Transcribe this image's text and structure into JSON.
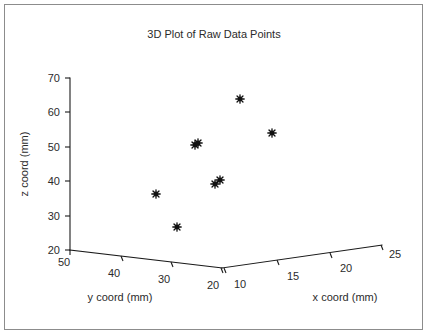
{
  "figure": {
    "border_color": "#8c8c8c",
    "background": "#ffffff",
    "ink_color": "#1a1a1a"
  },
  "chart_data": {
    "type": "scatter",
    "projection": "3d",
    "title": "3D Plot of Raw Data Points",
    "xlabel": "x coord (mm)",
    "ylabel": "y coord (mm)",
    "zlabel": "z coord (mm)",
    "xlim": [
      10,
      25
    ],
    "ylim": [
      20,
      50
    ],
    "zlim": [
      20,
      70
    ],
    "xticks": [
      10,
      15,
      20,
      25
    ],
    "yticks": [
      50,
      40,
      30,
      20
    ],
    "zticks": [
      20,
      30,
      40,
      50,
      60,
      70
    ],
    "xtick_labels": [
      "10",
      "15",
      "20",
      "25"
    ],
    "ytick_labels": [
      "50",
      "40",
      "30",
      "20"
    ],
    "ztick_labels": [
      "20",
      "30",
      "40",
      "50",
      "60",
      "70"
    ],
    "grid": false,
    "legend": false,
    "marker": "star",
    "marker_color": "#111111",
    "points": [
      {
        "x": 17.0,
        "y": 29.5,
        "z": 63.5,
        "px": 240,
        "py": 99
      },
      {
        "x": 21.5,
        "y": 26.0,
        "z": 53.0,
        "px": 272,
        "py": 133
      },
      {
        "x": 15.5,
        "y": 33.5,
        "z": 50.0,
        "px": 195,
        "py": 145
      },
      {
        "x": 15.8,
        "y": 33.0,
        "z": 50.3,
        "px": 198,
        "py": 143
      },
      {
        "x": 16.5,
        "y": 31.5,
        "z": 39.5,
        "px": 220,
        "py": 180
      },
      {
        "x": 16.0,
        "y": 32.0,
        "z": 38.8,
        "px": 215,
        "py": 184
      },
      {
        "x": 13.0,
        "y": 37.5,
        "z": 36.5,
        "px": 156,
        "py": 194
      },
      {
        "x": 14.0,
        "y": 35.5,
        "z": 25.5,
        "px": 177,
        "py": 227
      }
    ]
  },
  "axes_geometry": {
    "z_axis": {
      "x": 70,
      "y_top": 78,
      "y_bottom": 250
    },
    "y_axis": {
      "x1": 70,
      "y1": 250,
      "x2": 222,
      "y2": 268
    },
    "x_axis": {
      "x1": 222,
      "y1": 268,
      "x2": 382,
      "y2": 245
    }
  }
}
